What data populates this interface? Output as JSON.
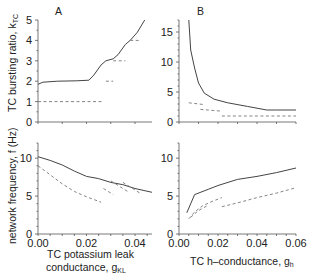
{
  "chart_data": [
    {
      "panel": "A",
      "position": "top-left",
      "type": "line",
      "title": "A",
      "xlabel": "",
      "ylabel": "TC bursting ratio, k_TC",
      "xlim": [
        0,
        0.047
      ],
      "ylim": [
        0,
        5
      ],
      "yticks": [
        0,
        1,
        2,
        3,
        4,
        5
      ],
      "series": [
        {
          "name": "solid",
          "style": "solid",
          "x": [
            0.0,
            0.002,
            0.008,
            0.016,
            0.021,
            0.023,
            0.026,
            0.028,
            0.031,
            0.033,
            0.036,
            0.038,
            0.041,
            0.044
          ],
          "y": [
            1.85,
            1.95,
            2.0,
            2.02,
            2.05,
            2.3,
            2.8,
            3.0,
            3.1,
            3.3,
            3.8,
            4.0,
            4.4,
            5.0
          ]
        },
        {
          "name": "dashed-1",
          "style": "dashed",
          "x": [
            0.0,
            0.027
          ],
          "y": [
            1.0,
            1.0
          ]
        },
        {
          "name": "dashed-2",
          "style": "dashed",
          "x": [
            0.028,
            0.031
          ],
          "y": [
            2.0,
            2.0
          ]
        },
        {
          "name": "dashed-3",
          "style": "dashed",
          "x": [
            0.031,
            0.036
          ],
          "y": [
            3.0,
            3.0
          ]
        },
        {
          "name": "dashed-4",
          "style": "dashed",
          "x": [
            0.038,
            0.042
          ],
          "y": [
            4.0,
            4.0
          ]
        }
      ]
    },
    {
      "panel": "B",
      "position": "top-right",
      "type": "line",
      "title": "B",
      "xlabel": "",
      "ylabel": "",
      "xlim": [
        0,
        0.06
      ],
      "ylim": [
        0,
        17
      ],
      "yticks": [
        0,
        5,
        10,
        15
      ],
      "series": [
        {
          "name": "solid",
          "style": "solid",
          "x": [
            0.005,
            0.006,
            0.008,
            0.01,
            0.013,
            0.018,
            0.025,
            0.035,
            0.045,
            0.05,
            0.06
          ],
          "y": [
            17,
            12,
            9,
            6.5,
            4.8,
            3.8,
            3.2,
            2.6,
            2.0,
            2.0,
            2.0
          ]
        },
        {
          "name": "dashed-1",
          "style": "dashed",
          "x": [
            0.005,
            0.013
          ],
          "y": [
            3.2,
            2.9
          ]
        },
        {
          "name": "dashed-2",
          "style": "dashed",
          "x": [
            0.011,
            0.022
          ],
          "y": [
            2.1,
            1.8
          ]
        },
        {
          "name": "dashed-3",
          "style": "dashed",
          "x": [
            0.022,
            0.06
          ],
          "y": [
            1.0,
            1.0
          ]
        }
      ]
    },
    {
      "panel": "A",
      "position": "bottom-left",
      "type": "line",
      "xlabel": "TC potassium leak conductance, g_KL",
      "ylabel": "network frequency, f (Hz)",
      "xlim": [
        0,
        0.047
      ],
      "ylim": [
        0,
        12
      ],
      "xticks": [
        "0.00",
        "0.02",
        "0.04"
      ],
      "yticks": [
        0,
        5,
        10
      ],
      "series": [
        {
          "name": "solid",
          "style": "solid",
          "x": [
            0.0,
            0.005,
            0.01,
            0.015,
            0.02,
            0.025,
            0.03,
            0.035,
            0.04,
            0.047
          ],
          "y": [
            10.2,
            9.7,
            9.1,
            8.3,
            7.6,
            7.3,
            6.8,
            6.5,
            6.0,
            5.5
          ]
        },
        {
          "name": "dashed-1",
          "style": "dashed",
          "x": [
            0.0,
            0.005,
            0.01,
            0.015,
            0.02,
            0.026
          ],
          "y": [
            9.0,
            7.8,
            6.6,
            5.6,
            4.9,
            4.2
          ]
        },
        {
          "name": "dashed-2",
          "style": "dashed",
          "x": [
            0.027,
            0.031
          ],
          "y": [
            6.0,
            5.2
          ]
        },
        {
          "name": "dashed-3",
          "style": "dashed",
          "x": [
            0.03,
            0.037
          ],
          "y": [
            7.0,
            5.6
          ]
        },
        {
          "name": "dashed-4",
          "style": "dashed",
          "x": [
            0.035,
            0.042
          ],
          "y": [
            6.8,
            5.4
          ]
        }
      ]
    },
    {
      "panel": "B",
      "position": "bottom-right",
      "type": "line",
      "xlabel": "TC h-conductance, g_h",
      "ylabel": "",
      "xlim": [
        0,
        0.06
      ],
      "ylim": [
        0,
        12
      ],
      "xticks": [
        "0.00",
        "0.02",
        "0.04",
        "0.06"
      ],
      "yticks": [
        0,
        5,
        10
      ],
      "series": [
        {
          "name": "solid",
          "style": "solid",
          "x": [
            0.004,
            0.008,
            0.015,
            0.02,
            0.03,
            0.04,
            0.05,
            0.06
          ],
          "y": [
            2.8,
            5.2,
            5.9,
            6.4,
            7.2,
            7.6,
            8.1,
            8.7
          ]
        },
        {
          "name": "dashed-1",
          "style": "dashed",
          "x": [
            0.005,
            0.008,
            0.012,
            0.017,
            0.022
          ],
          "y": [
            2.0,
            2.9,
            3.7,
            4.3,
            4.8
          ]
        },
        {
          "name": "dashed-2",
          "style": "dashed",
          "x": [
            0.006,
            0.01,
            0.015
          ],
          "y": [
            2.2,
            3.1,
            3.8
          ]
        },
        {
          "name": "dashed-3",
          "style": "dashed",
          "x": [
            0.022,
            0.03,
            0.04,
            0.05,
            0.06
          ],
          "y": [
            3.6,
            4.1,
            4.8,
            5.4,
            6.1
          ]
        }
      ]
    }
  ],
  "labels": {
    "panel_a": "A",
    "panel_b": "B",
    "ylabel_top": "TC bursting ratio, k",
    "ylabel_top_sub": "TC",
    "ylabel_bottom": "network frequency, f (Hz)",
    "xlabel_a_line1": "TC potassium leak",
    "xlabel_a_line2": "conductance, g",
    "xlabel_a_sub": "KL",
    "xlabel_b": "TC h–conductance, g",
    "xlabel_b_sub": "h"
  }
}
